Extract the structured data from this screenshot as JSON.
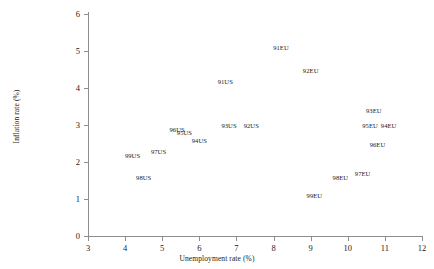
{
  "chart_data": {
    "type": "scatter",
    "title": "",
    "xlabel": "Unemployment rate (%)",
    "ylabel": "Inflation rate (%)",
    "xlim": [
      3,
      12
    ],
    "ylim": [
      0,
      6
    ],
    "xticks": [
      3,
      4,
      5,
      6,
      7,
      8,
      9,
      10,
      11,
      12
    ],
    "yticks": [
      0,
      1,
      2,
      3,
      4,
      5,
      6
    ],
    "grid": false,
    "legend": "none",
    "marker_style": "text-label",
    "series": [
      {
        "name": "US",
        "points": [
          {
            "label": "91US",
            "x": 6.7,
            "y": 4.2
          },
          {
            "label": "92US",
            "x": 7.4,
            "y": 3.0
          },
          {
            "label": "93US",
            "x": 6.8,
            "y": 3.0
          },
          {
            "label": "94US",
            "x": 6.0,
            "y": 2.6
          },
          {
            "label": "95US",
            "x": 5.6,
            "y": 2.8
          },
          {
            "label": "96US",
            "x": 5.4,
            "y": 2.9
          },
          {
            "label": "97US",
            "x": 4.9,
            "y": 2.3
          },
          {
            "label": "98US",
            "x": 4.5,
            "y": 1.6
          },
          {
            "label": "99US",
            "x": 4.2,
            "y": 2.2
          }
        ]
      },
      {
        "name": "EU",
        "points": [
          {
            "label": "91EU",
            "x": 8.2,
            "y": 5.1
          },
          {
            "label": "92EU",
            "x": 9.0,
            "y": 4.5
          },
          {
            "label": "93EU",
            "x": 10.7,
            "y": 3.4
          },
          {
            "label": "94EU",
            "x": 11.1,
            "y": 3.0
          },
          {
            "label": "95EU",
            "x": 10.6,
            "y": 3.0
          },
          {
            "label": "96EU",
            "x": 10.8,
            "y": 2.5
          },
          {
            "label": "97EU",
            "x": 10.4,
            "y": 1.7
          },
          {
            "label": "98EU",
            "x": 9.8,
            "y": 1.6
          },
          {
            "label": "99EU",
            "x": 9.1,
            "y": 1.1
          }
        ]
      }
    ]
  }
}
